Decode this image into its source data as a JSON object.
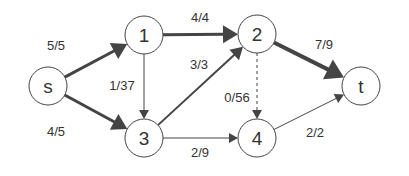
{
  "graph": {
    "type": "flow-network",
    "colors": {
      "stroke": "#444444",
      "node_fill": "#ffffff",
      "text": "#333333",
      "background": "#ffffff"
    },
    "nodes": [
      {
        "id": "s",
        "label": "s",
        "x": 48,
        "y": 86
      },
      {
        "id": "1",
        "label": "1",
        "x": 144,
        "y": 35
      },
      {
        "id": "2",
        "label": "2",
        "x": 257,
        "y": 34
      },
      {
        "id": "3",
        "label": "3",
        "x": 144,
        "y": 138
      },
      {
        "id": "4",
        "label": "4",
        "x": 257,
        "y": 138
      },
      {
        "id": "t",
        "label": "t",
        "x": 361,
        "y": 86
      }
    ],
    "edges": [
      {
        "from": "s",
        "to": "1",
        "label": "5/5",
        "flow": 5,
        "capacity": 5,
        "width": 3,
        "dashed": false,
        "lx": 56,
        "ly": 50
      },
      {
        "from": "s",
        "to": "3",
        "label": "4/5",
        "flow": 4,
        "capacity": 5,
        "width": 3,
        "dashed": false,
        "lx": 56,
        "ly": 136
      },
      {
        "from": "1",
        "to": "2",
        "label": "4/4",
        "flow": 4,
        "capacity": 4,
        "width": 3,
        "dashed": false,
        "lx": 200,
        "ly": 22
      },
      {
        "from": "1",
        "to": "3",
        "label": "1/37",
        "flow": 1,
        "capacity": 37,
        "width": 1,
        "dashed": false,
        "lx": 122,
        "ly": 90
      },
      {
        "from": "3",
        "to": "2",
        "label": "3/3",
        "flow": 3,
        "capacity": 3,
        "width": 2,
        "dashed": false,
        "lx": 199,
        "ly": 69
      },
      {
        "from": "2",
        "to": "4",
        "label": "0/56",
        "flow": 0,
        "capacity": 56,
        "width": 1,
        "dashed": true,
        "lx": 237,
        "ly": 102
      },
      {
        "from": "2",
        "to": "t",
        "label": "7/9",
        "flow": 7,
        "capacity": 9,
        "width": 4,
        "dashed": false,
        "lx": 324,
        "ly": 49
      },
      {
        "from": "3",
        "to": "4",
        "label": "2/9",
        "flow": 2,
        "capacity": 9,
        "width": 1,
        "dashed": false,
        "lx": 200,
        "ly": 157
      },
      {
        "from": "4",
        "to": "t",
        "label": "2/2",
        "flow": 2,
        "capacity": 2,
        "width": 1,
        "dashed": false,
        "lx": 315,
        "ly": 137
      }
    ]
  }
}
